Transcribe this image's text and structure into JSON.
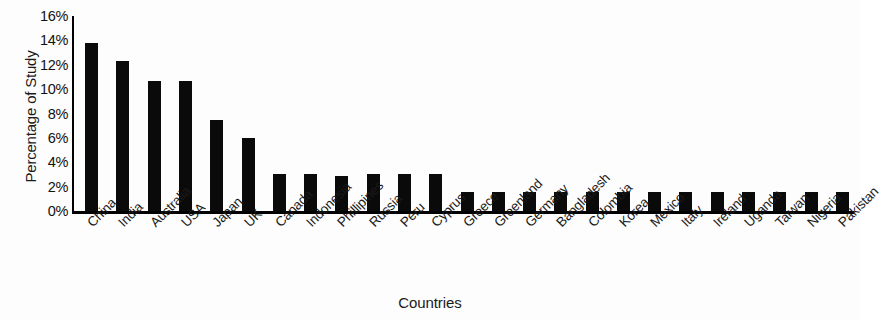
{
  "chart_data": {
    "type": "bar",
    "title": "",
    "xlabel": "Countries",
    "ylabel": "Percentage of Study",
    "ylim": [
      0,
      16
    ],
    "ytick_labels": [
      "16%",
      "14%",
      "12%",
      "10%",
      "8%",
      "6%",
      "4%",
      "2%",
      "0%"
    ],
    "ytick_values": [
      16,
      14,
      12,
      10,
      8,
      6,
      4,
      2,
      0
    ],
    "grid": false,
    "legend": null,
    "bar_color": "#0a0a0a",
    "axis_color": "#000000",
    "categories": [
      "China",
      "India",
      "Australia",
      "USA",
      "Japan",
      "UK",
      "Canada",
      "Indonesia",
      "Phillipines",
      "Russia",
      "Peru",
      "Cyprus",
      "Greece",
      "Greenland",
      "Germany",
      "Bangladesh",
      "Colombia",
      "Korea",
      "Mexico",
      "Italy",
      "Ireland",
      "Uganda",
      "Taiwan",
      "Nigeria",
      "Pakistan"
    ],
    "values": [
      13.8,
      12.3,
      10.7,
      10.7,
      7.5,
      6.0,
      3.0,
      3.0,
      2.9,
      3.0,
      3.0,
      3.0,
      1.6,
      1.6,
      1.6,
      1.6,
      1.6,
      1.6,
      1.6,
      1.6,
      1.6,
      1.6,
      1.6,
      1.6,
      1.6
    ],
    "value_unit": "%"
  }
}
